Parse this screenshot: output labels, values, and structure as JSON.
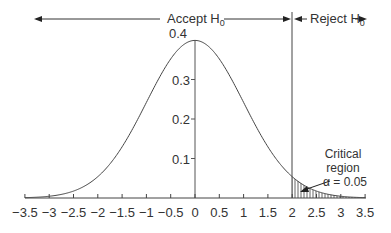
{
  "chart_data": {
    "type": "line",
    "title": "",
    "xlabel": "",
    "ylabel": "",
    "x_ticks": [
      -3.5,
      -3,
      -2.5,
      -2,
      -1.5,
      -1,
      -0.5,
      0,
      0.5,
      1,
      1.5,
      2,
      2.5,
      3,
      3.5
    ],
    "x_tick_labels": [
      "−3.5",
      "−3",
      "−2.5",
      "−2",
      "−1.5",
      "−1",
      "−0.5",
      "0",
      "0.5",
      "1",
      "1.5",
      "2",
      "2.5",
      "3",
      "3.5"
    ],
    "y_ticks": [
      0.1,
      0.2,
      0.3,
      0.4
    ],
    "y_tick_labels": [
      "0.1",
      "0.2",
      "0.3",
      "0.4"
    ],
    "xlim": [
      -3.5,
      3.5
    ],
    "ylim": [
      0,
      0.4
    ],
    "grid": false,
    "series": [
      {
        "name": "Standard normal density",
        "x": [
          -3.5,
          -3,
          -2.5,
          -2,
          -1.5,
          -1,
          -0.5,
          0,
          0.5,
          1,
          1.5,
          2,
          2.5,
          3,
          3.5
        ],
        "values": [
          0.0009,
          0.0044,
          0.0175,
          0.054,
          0.1295,
          0.242,
          0.3521,
          0.3989,
          0.3521,
          0.242,
          0.1295,
          0.054,
          0.0175,
          0.0044,
          0.0009
        ]
      }
    ],
    "critical_value": 2,
    "shaded_region": {
      "from": 2,
      "to": 3.5,
      "pattern": "vertical-hatch"
    },
    "annotations": {
      "accept_label": "Accept H",
      "accept_sub": "0",
      "reject_label": "Reject H",
      "reject_sub": "0",
      "critical_line1": "Critical",
      "critical_line2": "region",
      "critical_line3": "α = 0.05"
    }
  },
  "colors": {
    "line": "#444444",
    "text": "#333333",
    "hatch": "#555555",
    "background": "#ffffff"
  }
}
